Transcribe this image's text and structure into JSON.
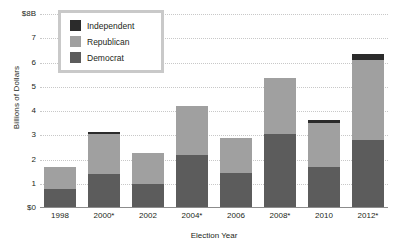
{
  "chart_data": {
    "type": "bar",
    "subtype": "stacked-bar",
    "title": "",
    "xlabel": "Election Year",
    "ylabel": "Billions of Dollars",
    "categories": [
      "1998",
      "2000*",
      "2002",
      "2004*",
      "2006",
      "2008*",
      "2010",
      "2012*"
    ],
    "ylim": [
      0,
      8
    ],
    "y_ticks": [
      "$0",
      "1",
      "2",
      "3",
      "4",
      "5",
      "6",
      "7",
      "$8B"
    ],
    "y_tick_values": [
      0,
      1,
      2,
      3,
      4,
      5,
      6,
      7,
      8
    ],
    "grid": true,
    "legend_position": "top-left",
    "series": [
      {
        "name": "Democrat",
        "color": "#5c5c5c",
        "values": [
          0.8,
          1.4,
          1.0,
          2.2,
          1.45,
          3.05,
          1.7,
          2.8
        ]
      },
      {
        "name": "Republican",
        "color": "#a0a0a0",
        "values": [
          0.9,
          1.65,
          1.25,
          2.0,
          1.45,
          2.3,
          1.8,
          3.3
        ]
      },
      {
        "name": "Independent",
        "color": "#2b2b2b",
        "values": [
          0.0,
          0.1,
          0.0,
          0.0,
          0.0,
          0.0,
          0.15,
          0.25
        ]
      }
    ],
    "totals": [
      1.7,
      3.15,
      2.25,
      4.2,
      2.9,
      5.35,
      3.65,
      6.35
    ]
  },
  "legend": {
    "items": [
      {
        "label": "Independent",
        "color": "#2b2b2b"
      },
      {
        "label": "Republican",
        "color": "#a0a0a0"
      },
      {
        "label": "Democrat",
        "color": "#5c5c5c"
      }
    ]
  },
  "colors": {
    "independent": "#2b2b2b",
    "republican": "#a0a0a0",
    "democrat": "#5c5c5c",
    "gridline": "#c8c8c8",
    "axis": "#8c8c8c",
    "text": "#231f20",
    "legend_border": "#c9c9c9",
    "background": "#ffffff"
  }
}
